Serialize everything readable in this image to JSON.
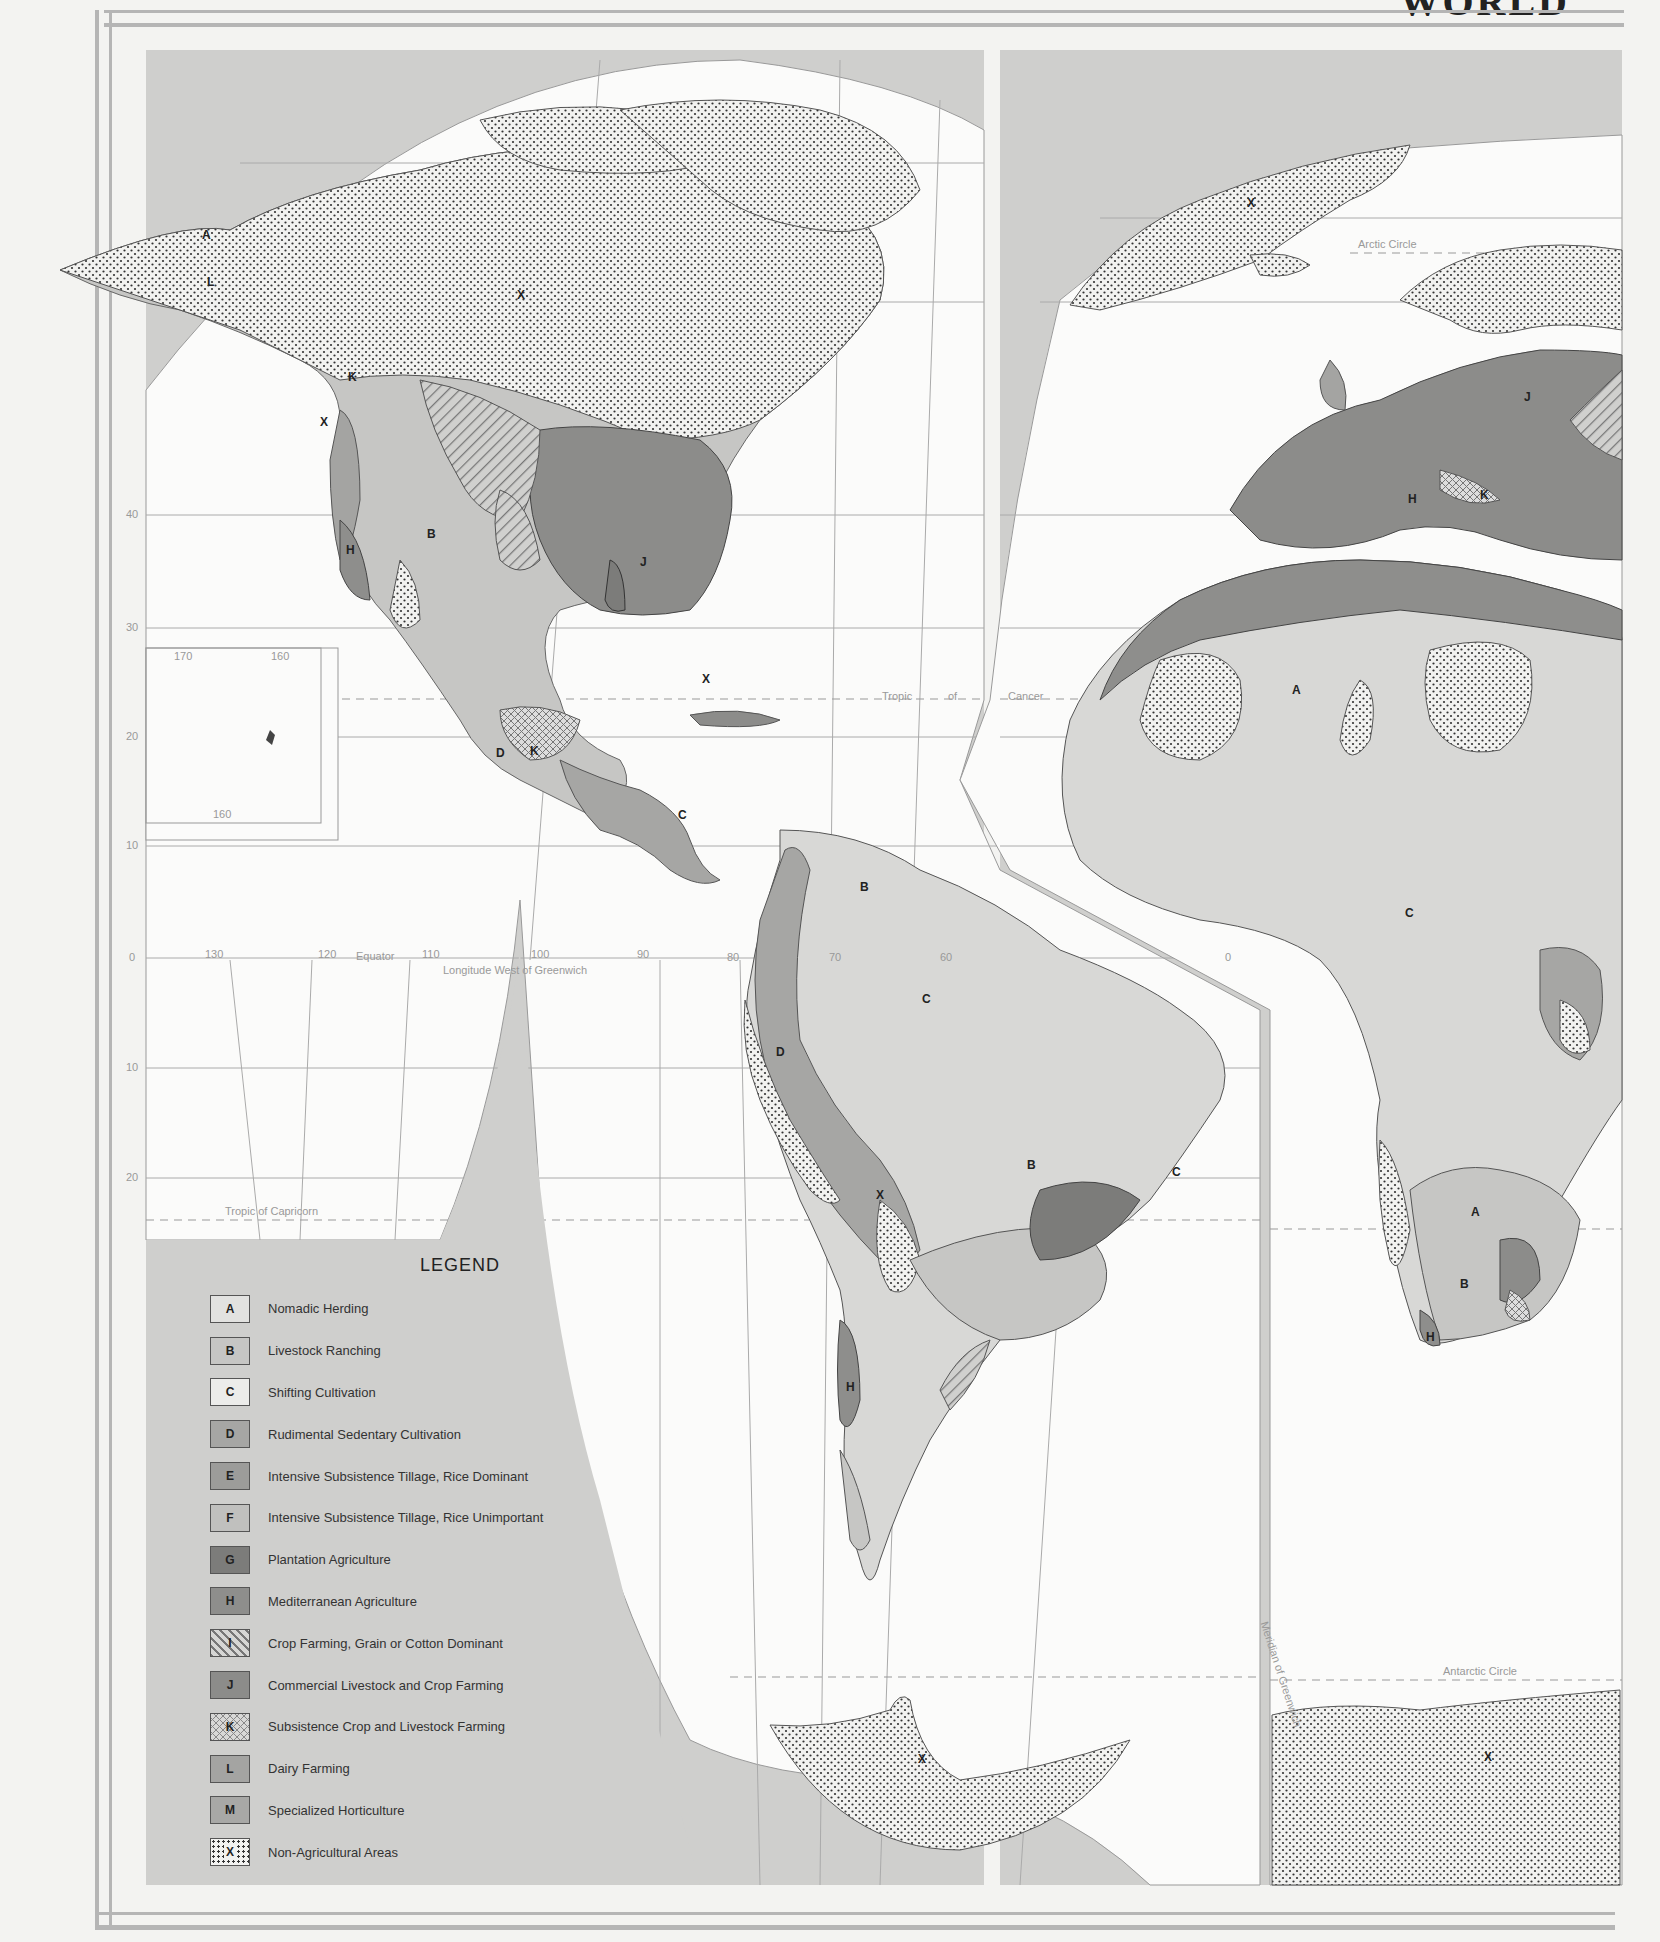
{
  "map": {
    "title": "WORLD",
    "subject": "Agricultural Regions of the World",
    "colors": {
      "ocean": "#cfcfcd",
      "paper": "#f3f3f1",
      "frame": "#b5b5b5",
      "A": "#e2e2e0",
      "B": "#c6c6c4",
      "C": "#d8d8d6",
      "D": "#a6a6a4",
      "E": "#9c9c9a",
      "F": "#c0c0be",
      "G": "#7c7c7a",
      "H": "#8e8e8c",
      "I": "#b9b9b7",
      "J": "#8c8c8a",
      "K": "#c6c6c4",
      "L": "#a4a4a2",
      "M": "#a8a8a6",
      "X": "#f0f0ee"
    },
    "graticule_labels": {
      "equator": "Equator",
      "longitude_note": "Longitude West of Greenwich",
      "tropic_cancer": [
        "Tropic",
        "of",
        "Cancer"
      ],
      "tropic_capricorn": "Tropic of Capricorn",
      "arctic_circle": "Arctic Circle",
      "antarctic_circle": "Antarctic Circle",
      "greenwich": "Meridian of Greenwich",
      "lat_left": [
        "40",
        "30",
        "20",
        "10",
        "0",
        "10",
        "20"
      ],
      "lon_equator": [
        "130",
        "120",
        "110",
        "100",
        "90",
        "80",
        "70",
        "60",
        "0"
      ],
      "inset_lon": [
        "170",
        "160",
        "160"
      ],
      "lat_arc": [
        "80",
        "70",
        "60",
        "80",
        "70",
        "60",
        "70",
        "80",
        "20"
      ]
    },
    "region_labels": {
      "north_america": [
        "A",
        "L",
        "X",
        "K",
        "X",
        "M",
        "L",
        "I",
        "L",
        "L",
        "M",
        "J",
        "L",
        "M",
        "B",
        "B",
        "M",
        "I",
        "M",
        "H",
        "J",
        "X",
        "M",
        "G",
        "G",
        "J",
        "G",
        "M",
        "G",
        "G",
        "D",
        "K",
        "K",
        "X"
      ],
      "central_america": [
        "G",
        "D",
        "G",
        "C"
      ],
      "south_america": [
        "C",
        "B",
        "G",
        "B",
        "D",
        "C",
        "D",
        "G",
        "D",
        "K",
        "G",
        "M",
        "G",
        "K",
        "M",
        "X",
        "B",
        "C",
        "G",
        "D",
        "G",
        "D",
        "D",
        "J",
        "M",
        "L",
        "I",
        "H"
      ],
      "europe_africa": [
        "X",
        "X",
        "L",
        "J",
        "H",
        "K",
        "A",
        "H",
        "M",
        "A",
        "M",
        "X",
        "M",
        "M",
        "X",
        "F",
        "D",
        "D",
        "G",
        "D",
        "G",
        "D",
        "C",
        "G",
        "D",
        "X",
        "D",
        "G",
        "J",
        "A",
        "X",
        "D",
        "M",
        "J",
        "B",
        "K",
        "H"
      ],
      "antarctica": [
        "X",
        "X"
      ]
    }
  },
  "legend": {
    "title": "LEGEND",
    "items": [
      {
        "code": "A",
        "label": "Nomadic Herding",
        "pattern": "plain-light"
      },
      {
        "code": "B",
        "label": "Livestock Ranching",
        "pattern": "plain-medium-light"
      },
      {
        "code": "C",
        "label": "Shifting Cultivation",
        "pattern": "plain-very-light"
      },
      {
        "code": "D",
        "label": "Rudimental Sedentary Cultivation",
        "pattern": "plain-medium"
      },
      {
        "code": "E",
        "label": "Intensive Subsistence Tillage, Rice Dominant",
        "pattern": "plain-medium-dark"
      },
      {
        "code": "F",
        "label": "Intensive Subsistence Tillage, Rice Unimportant",
        "pattern": "plain-medium-light"
      },
      {
        "code": "G",
        "label": "Plantation Agriculture",
        "pattern": "plain-dark"
      },
      {
        "code": "H",
        "label": "Mediterranean Agriculture",
        "pattern": "plain-dark"
      },
      {
        "code": "I",
        "label": "Crop Farming, Grain or Cotton Dominant",
        "pattern": "diagonal-hatch"
      },
      {
        "code": "J",
        "label": "Commercial Livestock and Crop Farming",
        "pattern": "plain-dark"
      },
      {
        "code": "K",
        "label": "Subsistence Crop and Livestock Farming",
        "pattern": "cross-hatch"
      },
      {
        "code": "L",
        "label": "Dairy Farming",
        "pattern": "plain-medium"
      },
      {
        "code": "M",
        "label": "Specialized Horticulture",
        "pattern": "plain-medium"
      },
      {
        "code": "X",
        "label": "Non-Agricultural Areas",
        "pattern": "dotted"
      }
    ]
  }
}
